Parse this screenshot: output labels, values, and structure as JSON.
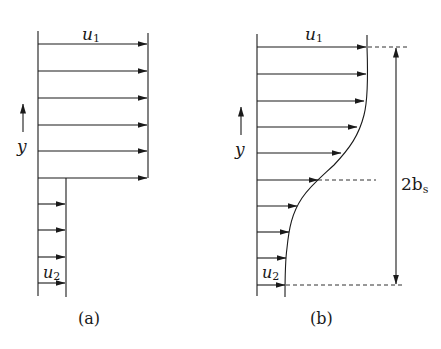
{
  "panel_a": {
    "caption": "(a)",
    "upper_velocity": "u",
    "upper_velocity_sub": "1",
    "lower_velocity": "u",
    "lower_velocity_sub": "2",
    "axis_label": "y"
  },
  "panel_b": {
    "caption": "(b)",
    "upper_velocity": "u",
    "upper_velocity_sub": "1",
    "lower_velocity": "u",
    "lower_velocity_sub": "2",
    "axis_label": "y",
    "width_label": "2b",
    "width_label_sub": "s"
  },
  "colors": {
    "line": "#1a1a1a",
    "background": "#ffffff"
  }
}
